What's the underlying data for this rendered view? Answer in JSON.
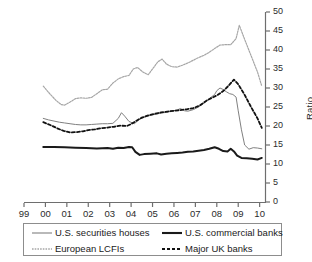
{
  "chart_data": {
    "type": "line",
    "title": "",
    "xlabel": "",
    "ylabel": "Ratio",
    "ylim": [
      0,
      50
    ],
    "yticks": [
      0,
      5,
      10,
      15,
      20,
      25,
      30,
      35,
      40,
      45,
      50
    ],
    "xlim": [
      1999,
      2010.25
    ],
    "xticks": [
      1999,
      2000,
      2001,
      2002,
      2003,
      2004,
      2005,
      2006,
      2007,
      2008,
      2009,
      2010
    ],
    "xticklabels": [
      "99",
      "00",
      "01",
      "02",
      "03",
      "04",
      "05",
      "06",
      "07",
      "08",
      "09",
      "10"
    ],
    "grid": false,
    "legend_position": "below",
    "axis_side": "right",
    "series": [
      {
        "name": "U.S. securities houses",
        "style": "solid",
        "color": "#808080",
        "width": 1.0,
        "x": [
          1999.9,
          2000.15,
          2000.4,
          2000.65,
          2000.9,
          2001.15,
          2001.4,
          2001.65,
          2001.9,
          2002.15,
          2002.4,
          2002.65,
          2002.9,
          2003.15,
          2003.4,
          2003.55,
          2003.7,
          2003.9,
          2004.15,
          2004.4,
          2004.65,
          2004.9,
          2005.15,
          2005.4,
          2005.65,
          2005.9,
          2006.15,
          2006.3,
          2006.5,
          2006.65,
          2006.9,
          2007.15,
          2007.4,
          2007.65,
          2007.9,
          2008.0,
          2008.15,
          2008.3,
          2008.45,
          2008.6,
          2008.75,
          2008.9,
          2009.0,
          2009.15,
          2009.3,
          2009.5,
          2009.7,
          2009.9,
          2010.1
        ],
        "y": [
          22.0,
          21.6,
          21.3,
          21.0,
          20.8,
          20.6,
          20.4,
          20.3,
          20.3,
          20.4,
          20.5,
          20.6,
          20.6,
          20.7,
          22.0,
          23.5,
          22.6,
          21.2,
          20.6,
          21.8,
          22.4,
          22.8,
          23.1,
          23.4,
          23.6,
          23.9,
          24.2,
          24.6,
          24.0,
          23.9,
          24.3,
          25.0,
          26.0,
          27.2,
          28.3,
          29.3,
          30.0,
          29.6,
          29.0,
          28.5,
          28.3,
          27.6,
          24.0,
          19.0,
          15.0,
          13.9,
          14.3,
          14.2,
          14.0
        ]
      },
      {
        "name": "U.S. commercial banks",
        "style": "solid",
        "color": "#1a1a1a",
        "width": 2.0,
        "x": [
          1999.9,
          2000.4,
          2000.9,
          2001.4,
          2001.9,
          2002.4,
          2002.9,
          2003.15,
          2003.4,
          2003.65,
          2003.9,
          2004.05,
          2004.2,
          2004.4,
          2004.6,
          2004.9,
          2005.2,
          2005.4,
          2005.65,
          2005.9,
          2006.15,
          2006.4,
          2006.65,
          2006.9,
          2007.15,
          2007.4,
          2007.65,
          2007.9,
          2008.1,
          2008.3,
          2008.5,
          2008.65,
          2008.8,
          2008.95,
          2009.15,
          2009.4,
          2009.65,
          2009.9,
          2010.1
        ],
        "y": [
          14.5,
          14.5,
          14.4,
          14.3,
          14.2,
          14.1,
          14.2,
          14.0,
          14.3,
          14.2,
          14.5,
          14.4,
          13.2,
          12.4,
          12.6,
          12.7,
          12.8,
          12.5,
          12.7,
          12.8,
          12.9,
          13.0,
          13.2,
          13.3,
          13.5,
          13.7,
          14.0,
          14.4,
          14.0,
          13.4,
          13.3,
          14.0,
          13.3,
          12.2,
          11.6,
          11.5,
          11.4,
          11.2,
          11.6
        ]
      },
      {
        "name": "European LCFIs",
        "style": "dotted",
        "color": "#a6a6a6",
        "width": 1.2,
        "x": [
          1999.9,
          2000.2,
          2000.5,
          2000.75,
          2000.9,
          2001.15,
          2001.4,
          2001.65,
          2001.9,
          2002.15,
          2002.4,
          2002.65,
          2002.9,
          2003.15,
          2003.4,
          2003.65,
          2003.9,
          2004.1,
          2004.3,
          2004.55,
          2004.8,
          2005.0,
          2005.25,
          2005.45,
          2005.65,
          2005.9,
          2006.15,
          2006.4,
          2006.65,
          2006.9,
          2007.15,
          2007.4,
          2007.65,
          2007.9,
          2008.15,
          2008.4,
          2008.65,
          2008.9,
          2009.05,
          2009.3,
          2009.6,
          2009.9,
          2010.1
        ],
        "y": [
          30.5,
          28.5,
          26.7,
          25.6,
          25.5,
          26.3,
          27.2,
          27.4,
          27.3,
          27.5,
          28.5,
          29.5,
          29.7,
          31.3,
          32.4,
          33.0,
          33.3,
          35.0,
          35.4,
          34.2,
          33.5,
          35.0,
          36.9,
          37.6,
          36.3,
          35.6,
          35.5,
          36.0,
          36.6,
          37.3,
          38.0,
          38.6,
          39.4,
          40.4,
          41.3,
          41.4,
          41.4,
          43.0,
          46.5,
          42.8,
          38.5,
          34.2,
          30.5
        ]
      },
      {
        "name": "Major UK banks",
        "style": "dashed",
        "color": "#111111",
        "width": 1.8,
        "x": [
          1999.9,
          2000.25,
          2000.55,
          2000.85,
          2001.15,
          2001.45,
          2001.75,
          2002.0,
          2002.3,
          2002.6,
          2002.9,
          2003.2,
          2003.5,
          2003.8,
          2004.0,
          2004.25,
          2004.5,
          2004.8,
          2005.1,
          2005.4,
          2005.7,
          2006.0,
          2006.3,
          2006.6,
          2006.9,
          2007.2,
          2007.5,
          2007.8,
          2008.05,
          2008.3,
          2008.55,
          2008.8,
          2009.0,
          2009.3,
          2009.6,
          2009.9,
          2010.1
        ],
        "y": [
          21.0,
          20.2,
          19.4,
          18.7,
          18.3,
          18.4,
          18.6,
          18.9,
          19.1,
          19.4,
          19.6,
          19.8,
          20.1,
          20.0,
          20.5,
          21.4,
          22.2,
          22.8,
          23.2,
          23.6,
          23.8,
          24.0,
          24.2,
          24.4,
          24.7,
          25.4,
          26.6,
          27.5,
          28.2,
          29.2,
          30.6,
          32.2,
          31.0,
          28.2,
          25.0,
          22.0,
          19.5
        ]
      }
    ]
  },
  "axis": {
    "y_label": "Ratio",
    "y_tick_labels": [
      "0",
      "5",
      "10",
      "15",
      "20",
      "25",
      "30",
      "35",
      "40",
      "45",
      "50"
    ],
    "x_tick_labels": [
      "99",
      "00",
      "01",
      "02",
      "03",
      "04",
      "05",
      "06",
      "07",
      "08",
      "09",
      "10"
    ]
  },
  "legend": {
    "items": [
      {
        "label": "U.S. securities houses",
        "style": "solid-gray"
      },
      {
        "label": "U.S. commercial banks",
        "style": "solid-black-thick"
      },
      {
        "label": "European LCFIs",
        "style": "dotted-gray"
      },
      {
        "label": "Major UK banks",
        "style": "dashed-black"
      }
    ]
  },
  "colors": {
    "us_securities": "#808080",
    "us_commercial": "#1a1a1a",
    "european_lcfis": "#a6a6a6",
    "uk_banks": "#111111",
    "axis": "#6e6e6e",
    "text": "#1a1a1a"
  }
}
